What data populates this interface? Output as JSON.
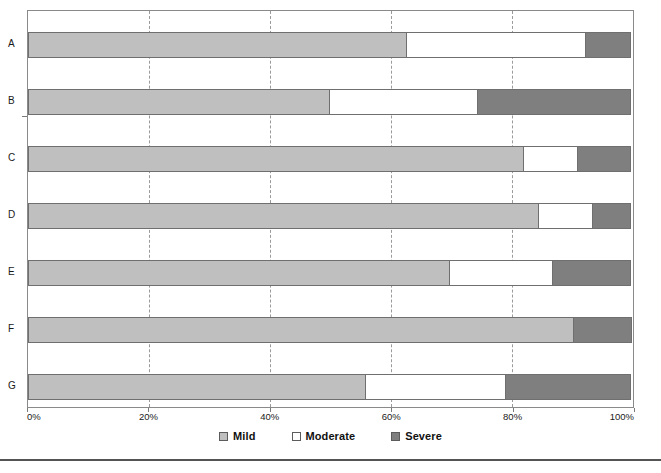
{
  "chart_data": {
    "type": "bar",
    "orientation": "horizontal",
    "stacked": true,
    "normalized_percent": true,
    "title": "",
    "subtitle": "",
    "xlabel": "",
    "ylabel": "",
    "xlim": [
      0,
      100
    ],
    "grid": true,
    "grid_style": "dashed-vertical",
    "legend_position": "bottom-center",
    "categories": [
      "A",
      "B",
      "C",
      "D",
      "E",
      "F",
      "G"
    ],
    "tick_values": [
      0,
      20,
      40,
      60,
      80,
      100
    ],
    "tick_labels": [
      "0%",
      "20%",
      "40%",
      "60%",
      "80%",
      "100%"
    ],
    "series": [
      {
        "name": "Mild",
        "color": "#bfbfbf",
        "values": [
          62.6,
          49.9,
          82.0,
          84.5,
          69.7,
          90.2,
          55.8
        ]
      },
      {
        "name": "Moderate",
        "color": "#ffffff",
        "values": [
          29.8,
          24.7,
          9.1,
          9.1,
          17.3,
          0.0,
          23.4
        ]
      },
      {
        "name": "Severe",
        "color": "#7f7f7f",
        "values": [
          7.6,
          25.4,
          8.9,
          6.4,
          13.0,
          9.8,
          20.8
        ]
      }
    ],
    "legend": [
      {
        "label": "Mild",
        "color": "#bfbfbf",
        "swatch": "mild"
      },
      {
        "label": "Moderate",
        "color": "#ffffff",
        "swatch": "moderate"
      },
      {
        "label": "Severe",
        "color": "#7f7f7f",
        "swatch": "severe"
      }
    ]
  },
  "footer": {
    "caption": ""
  }
}
